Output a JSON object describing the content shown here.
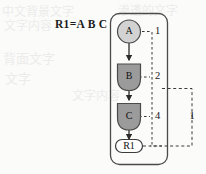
{
  "figure": {
    "type": "fault-tree-diagram",
    "formula": "R1=A B C",
    "background_ghost_text": [
      "中文背景文字",
      "渗透的文字",
      "文字内容",
      "背面文字",
      "文字"
    ]
  },
  "nodes": [
    {
      "id": "A",
      "label": "A",
      "shape": "circle",
      "fill": "#d2d2d2",
      "stroke": "#4a4a4a"
    },
    {
      "id": "B",
      "label": "B",
      "shape": "shield",
      "fill": "#9b9b9b",
      "stroke": "#4a4a4a"
    },
    {
      "id": "C",
      "label": "C",
      "shape": "shield",
      "fill": "#9b9b9b",
      "stroke": "#4a4a4a"
    },
    {
      "id": "R1",
      "label": "R1",
      "shape": "stadium",
      "fill": "#ffffff",
      "stroke": "#3c3c3c"
    }
  ],
  "edge_labels": {
    "a": "1",
    "b": "2",
    "c": "4",
    "outer": "1"
  },
  "colors": {
    "page_background": "#fbfbfa",
    "ink": "#1c1c1c",
    "node_light": "#d2d2d2",
    "node_dark": "#9b9b9b",
    "node_white": "#ffffff",
    "outline": "#4a4a4a",
    "dashed": "#3a3a3a"
  }
}
